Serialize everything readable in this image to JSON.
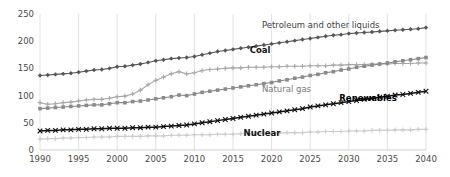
{
  "chart_data": {
    "type": "line",
    "title": "",
    "subtitle": "",
    "xlabel": "",
    "ylabel": "",
    "xlim": [
      1990,
      2040
    ],
    "ylim": [
      0,
      250
    ],
    "yticks": [
      0,
      50,
      100,
      150,
      200,
      250
    ],
    "xticks": [
      1990,
      1995,
      2000,
      2005,
      2010,
      2015,
      2020,
      2025,
      2030,
      2035,
      2040
    ],
    "grid": "vertical-only",
    "legend_position": "inline-annotations",
    "x": [
      1990,
      1991,
      1992,
      1993,
      1994,
      1995,
      1996,
      1997,
      1998,
      1999,
      2000,
      2001,
      2002,
      2003,
      2004,
      2005,
      2006,
      2007,
      2008,
      2009,
      2010,
      2011,
      2012,
      2013,
      2014,
      2015,
      2016,
      2017,
      2018,
      2019,
      2020,
      2021,
      2022,
      2023,
      2024,
      2025,
      2026,
      2027,
      2028,
      2029,
      2030,
      2031,
      2032,
      2033,
      2034,
      2035,
      2036,
      2037,
      2038,
      2039,
      2040
    ],
    "series": [
      {
        "name": "Petroleum and other liquids",
        "color": "#555555",
        "marker": "diamond",
        "values": [
          137,
          138,
          139,
          140,
          141,
          143,
          145,
          147,
          148,
          150,
          153,
          154,
          156,
          158,
          161,
          164,
          166,
          168,
          169,
          170,
          172,
          175,
          178,
          181,
          183,
          185,
          187,
          189,
          191,
          193,
          195,
          197,
          199,
          201,
          203,
          205,
          207,
          209,
          211,
          212,
          214,
          215,
          216,
          217,
          218,
          219,
          220,
          221,
          222,
          223,
          225
        ]
      },
      {
        "name": "Coal",
        "color": "#a8a8a8",
        "marker": "cross",
        "values": [
          87,
          84,
          85,
          87,
          88,
          90,
          92,
          93,
          93,
          95,
          98,
          99,
          103,
          110,
          120,
          128,
          134,
          140,
          144,
          140,
          142,
          146,
          148,
          149,
          150,
          151,
          151,
          152,
          152,
          152,
          153,
          153,
          154,
          154,
          154,
          155,
          155,
          155,
          156,
          156,
          157,
          157,
          157,
          158,
          158,
          158,
          159,
          159,
          159,
          160,
          160
        ]
      },
      {
        "name": "Natural gas",
        "color": "#8a8a8a",
        "marker": "square",
        "values": [
          76,
          77,
          78,
          79,
          80,
          81,
          82,
          83,
          83,
          85,
          87,
          87,
          89,
          90,
          92,
          94,
          96,
          98,
          101,
          100,
          103,
          106,
          108,
          110,
          112,
          114,
          116,
          118,
          120,
          122,
          124,
          127,
          129,
          132,
          134,
          137,
          139,
          142,
          144,
          147,
          149,
          152,
          154,
          156,
          158,
          160,
          162,
          164,
          166,
          168,
          170
        ]
      },
      {
        "name": "Renewables",
        "color": "#111111",
        "marker": "x",
        "values": [
          35,
          36,
          36,
          37,
          37,
          38,
          38,
          39,
          39,
          40,
          40,
          40,
          41,
          41,
          42,
          42,
          43,
          44,
          45,
          46,
          48,
          50,
          52,
          54,
          56,
          58,
          60,
          62,
          64,
          66,
          68,
          70,
          72,
          74,
          76,
          79,
          81,
          83,
          85,
          87,
          89,
          91,
          93,
          95,
          97,
          99,
          101,
          102,
          104,
          106,
          108
        ]
      },
      {
        "name": "Nuclear",
        "color": "#cccccc",
        "marker": "plus",
        "values": [
          20,
          21,
          21,
          22,
          22,
          23,
          23,
          24,
          24,
          24,
          25,
          25,
          25,
          25,
          26,
          26,
          26,
          27,
          27,
          27,
          28,
          28,
          28,
          29,
          29,
          29,
          30,
          30,
          30,
          31,
          31,
          31,
          32,
          32,
          32,
          33,
          33,
          34,
          34,
          34,
          35,
          35,
          35,
          36,
          36,
          36,
          37,
          37,
          37,
          38,
          38
        ]
      }
    ],
    "annotations": [
      {
        "text": "Petroleum and other liquids",
        "x_pct": 57.5,
        "y_px": 21
      },
      {
        "text": "Coal",
        "x_pct": 57.0,
        "y_px": 46
      },
      {
        "text": "Natural gas",
        "x_pct": 57.5,
        "y_px": 85
      },
      {
        "text": "Renewables",
        "x_pct": 85.0,
        "y_px": 94
      },
      {
        "text": "Nuclear",
        "x_pct": 57.5,
        "y_px": 129
      }
    ]
  }
}
